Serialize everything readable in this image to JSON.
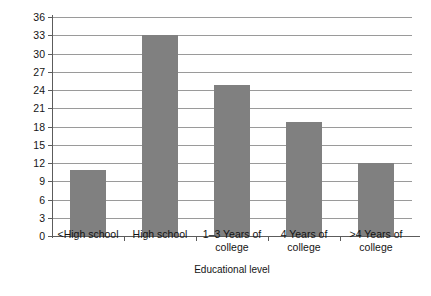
{
  "chart_data": {
    "type": "bar",
    "title": "",
    "xlabel": "Educational level",
    "ylabel": "Percent of population",
    "categories": [
      "<High school",
      "High school",
      "1–3 Years of\ncollege",
      "4 Years of\ncollege",
      ">4 Years of\ncollege"
    ],
    "category_lines": [
      [
        "<High school"
      ],
      [
        "High school"
      ],
      [
        "1–3 Years of",
        "college"
      ],
      [
        "4 Years of",
        "college"
      ],
      [
        ">4 Years of",
        "college"
      ]
    ],
    "values": [
      10.8,
      33.0,
      24.8,
      18.8,
      12.0
    ],
    "ylim": [
      0,
      36
    ],
    "ytick_step": 3,
    "yticks": [
      0,
      3,
      6,
      9,
      12,
      15,
      18,
      21,
      24,
      27,
      30,
      33,
      36
    ],
    "ytick_labels": [
      "0",
      "3",
      "6",
      "9",
      "12",
      "15",
      "18",
      "21",
      "24",
      "27",
      "30",
      "33",
      "36"
    ],
    "grid": true,
    "grid_axis": "y",
    "legend": false,
    "legend_position": "none",
    "bar_color": "#808080",
    "grid_color": "#9a9a9a",
    "axis_color": "#5c5c5c",
    "background": "#ffffff"
  }
}
